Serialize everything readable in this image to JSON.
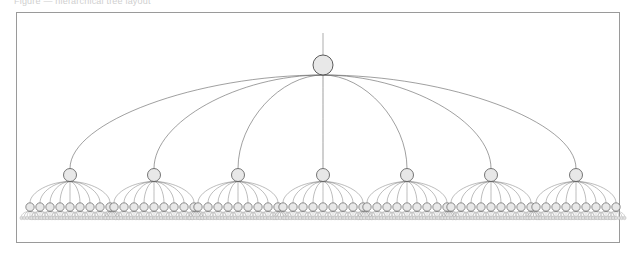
{
  "figure": {
    "caption": "Figure — hierarchical tree layout",
    "panel": {
      "x": 16,
      "y": 12,
      "width": 604,
      "height": 231,
      "border_color": "#9a9a9a",
      "background_color": "#ffffff"
    },
    "style": {
      "link_color": "#6f6f6f",
      "node_fill": "#e8e8e8",
      "node_stroke": "#4a4a4a",
      "leaf_fill": "#e0e0e0",
      "leaf_stroke": "#9b9b9b"
    }
  },
  "chart_data": {
    "type": "diagram",
    "title": "",
    "subtype": "tree",
    "orientation": "top-down",
    "edge_style": "s-curve",
    "levels": 4,
    "level_y": [
      65,
      175,
      207,
      218
    ],
    "node_radius": [
      10,
      6.5,
      4.2,
      1.7
    ],
    "counts": {
      "root": 1,
      "level1": 7,
      "level2": 63,
      "level3": 441
    },
    "root": {
      "x": 323,
      "y": 65,
      "label": ""
    },
    "root_stub": {
      "from_y": 33,
      "to_y": 55
    },
    "level1_x": [
      70,
      154,
      238,
      323,
      407,
      491,
      576
    ],
    "level1_children_per_node": 9,
    "level1_child_span": 40,
    "level2_children_per_node": 7,
    "level2_child_span": 8.5,
    "axis_ranges": {
      "x": [
        20,
        620
      ],
      "y": [
        12,
        243
      ]
    },
    "grid": false,
    "legend": null,
    "annotations": []
  }
}
